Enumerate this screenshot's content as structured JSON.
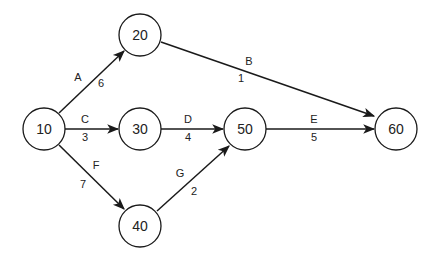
{
  "nodes": [
    {
      "id": "10",
      "label": "10",
      "x": 44,
      "y": 129
    },
    {
      "id": "20",
      "label": "20",
      "x": 140,
      "y": 35
    },
    {
      "id": "30",
      "label": "30",
      "x": 140,
      "y": 129
    },
    {
      "id": "40",
      "label": "40",
      "x": 140,
      "y": 226
    },
    {
      "id": "50",
      "label": "50",
      "x": 245,
      "y": 129
    },
    {
      "id": "60",
      "label": "60",
      "x": 396,
      "y": 129
    }
  ],
  "edges": [
    {
      "from": "10",
      "to": "20",
      "activity": "A",
      "duration": "6"
    },
    {
      "from": "20",
      "to": "60",
      "activity": "B",
      "duration": "1"
    },
    {
      "from": "10",
      "to": "30",
      "activity": "C",
      "duration": "3"
    },
    {
      "from": "30",
      "to": "50",
      "activity": "D",
      "duration": "4"
    },
    {
      "from": "50",
      "to": "60",
      "activity": "E",
      "duration": "5"
    },
    {
      "from": "10",
      "to": "40",
      "activity": "F",
      "duration": "7"
    },
    {
      "from": "40",
      "to": "50",
      "activity": "G",
      "duration": "2"
    }
  ]
}
